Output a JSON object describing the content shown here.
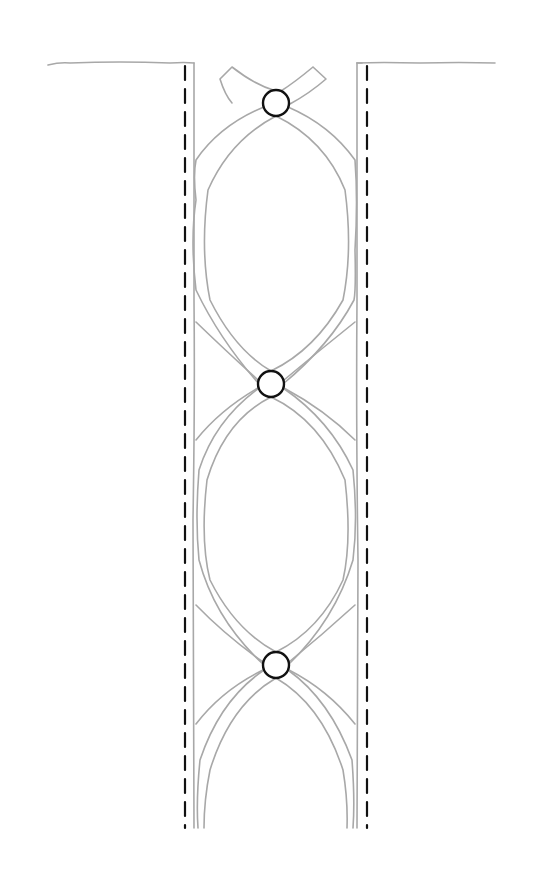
{
  "diagram": {
    "type": "sketch",
    "colors": {
      "pencil_line": "#a8a8a8",
      "dashed_line": "#111111",
      "circle_outline": "#111111",
      "background": "#ffffff"
    },
    "edges": {
      "top_line_y": 63,
      "left_solid_x": 194,
      "right_solid_x": 357,
      "left_dashed_x": 185,
      "right_dashed_x": 367,
      "bottom_y": 828
    },
    "circles": [
      {
        "cx": 276,
        "cy": 103,
        "r": 13
      },
      {
        "cx": 271,
        "cy": 384,
        "r": 13
      },
      {
        "cx": 276,
        "cy": 665,
        "r": 13
      }
    ],
    "loops": 2
  }
}
